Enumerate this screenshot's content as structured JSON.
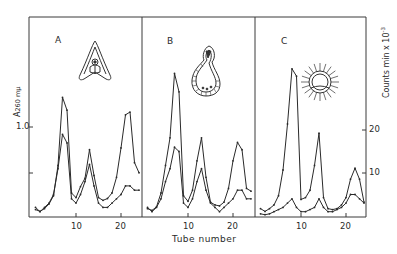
{
  "chart_data": [
    {
      "panel": "A",
      "type": "line",
      "title": "A",
      "xlabel": "Tube number",
      "ylabel_left": "A260 mμ",
      "ylabel_right": "Counts min × 10⁻³",
      "x": [
        1,
        2,
        3,
        4,
        5,
        6,
        7,
        8,
        9,
        10,
        11,
        12,
        13,
        14,
        15,
        16,
        17,
        18,
        19,
        20,
        21,
        22,
        23,
        24
      ],
      "series": [
        {
          "name": "A260 (absorbance)",
          "axis": "left",
          "values": [
            0.07,
            0.05,
            0.08,
            0.13,
            0.22,
            0.55,
            1.29,
            1.15,
            0.25,
            0.2,
            0.32,
            0.41,
            0.72,
            0.44,
            0.2,
            0.17,
            0.19,
            0.25,
            0.42,
            0.74,
            1.1,
            1.13,
            0.58,
            0.47
          ]
        },
        {
          "name": "Counts min x 10^-3",
          "axis": "right",
          "values": [
            2,
            1,
            2,
            3,
            5,
            11,
            19,
            17,
            4,
            3,
            5,
            8,
            12,
            7,
            3,
            2,
            2,
            3,
            4,
            5,
            7,
            7,
            6,
            6
          ]
        }
      ],
      "x_ticks": [
        10,
        20
      ],
      "y_left_ticks": [
        0.5,
        1.0
      ],
      "y_left_tick_labels": [
        "",
        "1.0"
      ],
      "ylim_left": [
        0,
        1.6
      ]
    },
    {
      "panel": "B",
      "type": "line",
      "title": "B",
      "xlabel": "Tube number",
      "x": [
        1,
        2,
        3,
        4,
        5,
        6,
        7,
        8,
        9,
        10,
        11,
        12,
        13,
        14,
        15,
        16,
        17,
        18,
        19,
        20,
        21,
        22,
        23,
        24
      ],
      "series": [
        {
          "name": "A260 (absorbance)",
          "axis": "left",
          "values": [
            0.08,
            0.06,
            0.1,
            0.25,
            0.55,
            0.85,
            1.55,
            1.35,
            0.22,
            0.16,
            0.28,
            0.6,
            0.85,
            0.42,
            0.15,
            0.12,
            0.11,
            0.15,
            0.3,
            0.6,
            0.8,
            0.72,
            0.3,
            0.27
          ]
        },
        {
          "name": "Counts min x 10^-3",
          "axis": "right",
          "values": [
            2,
            1,
            2,
            4,
            8,
            11,
            16,
            15,
            3,
            2,
            4,
            8,
            11,
            6,
            3,
            2,
            1,
            2,
            3,
            4,
            6,
            6,
            4,
            4
          ]
        }
      ],
      "x_ticks": [
        10,
        20
      ]
    },
    {
      "panel": "C",
      "type": "line",
      "title": "C",
      "xlabel": "Tube number",
      "x": [
        1,
        2,
        3,
        4,
        5,
        6,
        7,
        8,
        9,
        10,
        11,
        12,
        13,
        14,
        15,
        16,
        17,
        18,
        19,
        20,
        21,
        22,
        23,
        24
      ],
      "series": [
        {
          "name": "A260 (absorbance)",
          "axis": "left",
          "values": [
            0.08,
            0.05,
            0.08,
            0.12,
            0.22,
            0.5,
            1.0,
            1.6,
            1.52,
            0.18,
            0.2,
            0.28,
            0.55,
            0.9,
            0.2,
            0.08,
            0.07,
            0.08,
            0.12,
            0.2,
            0.4,
            0.52,
            0.4,
            0.15
          ]
        },
        {
          "name": "Counts min x 10^-3",
          "axis": "right",
          "values": [
            0.5,
            0.3,
            0.5,
            1,
            1.5,
            2,
            3,
            4,
            2,
            1,
            1,
            1.5,
            2,
            4,
            2,
            1,
            1,
            1.5,
            2,
            3,
            5,
            5,
            4,
            3
          ]
        }
      ],
      "x_ticks": [
        10,
        20
      ],
      "y_right_ticks": [
        10,
        20
      ],
      "y_right_tick_labels": [
        "10",
        "20"
      ],
      "ylim_right": [
        0,
        35
      ]
    }
  ],
  "figure": {
    "panel_labels": [
      "A",
      "B",
      "C"
    ],
    "xlabel": "Tube number",
    "ylabel_left_main": "A",
    "ylabel_left_sub": "260 mμ",
    "ylabel_right": "Counts min x 10",
    "ylabel_right_exp": "-3",
    "left_tick_label": "1.0",
    "right_tick_labels": [
      "20",
      "10"
    ],
    "x_tick_labels": [
      "10",
      "20"
    ],
    "illustrations": [
      "embryo-section-icon",
      "gastrula-icon",
      "blastula-icon"
    ]
  }
}
